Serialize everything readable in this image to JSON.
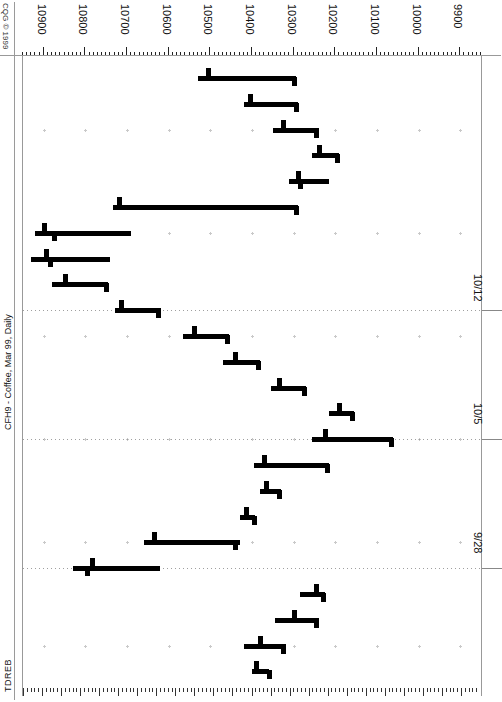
{
  "chart": {
    "copyright": "CQG © 1999",
    "title": "CFH9 - Coffee, Mar 99, Daily",
    "study_label": "TDREB",
    "orientation": "rotated-90",
    "accent_color": "#000000",
    "grid_color": "#c9c9c9",
    "frame_color": "#999999"
  },
  "price_axis": {
    "labels": [
      "10900",
      "10800",
      "10700",
      "10600",
      "10500",
      "10400",
      "10300",
      "10200",
      "10100",
      "10000",
      "9900"
    ],
    "min": 9850,
    "max": 10950,
    "step": 100
  },
  "date_axis": {
    "labels": [
      "10/12",
      "10/5",
      "9/28"
    ]
  },
  "chart_data": {
    "type": "ohlc",
    "title": "CFH9 - Coffee, Mar 99, Daily",
    "xlabel": "Date",
    "ylabel": "Price",
    "ylim": [
      9850,
      10950
    ],
    "grid": true,
    "legend": false,
    "price_ticks": [
      10900,
      10800,
      10700,
      10600,
      10500,
      10400,
      10300,
      10200,
      10100,
      10000,
      9900
    ],
    "date_ticks": [
      "10/12",
      "10/5",
      "9/28"
    ],
    "columns": [
      "date",
      "open",
      "high",
      "low",
      "close"
    ],
    "bars": [
      {
        "date": "9/22",
        "open": 10395,
        "high": 10400,
        "low": 10360,
        "close": 10365
      },
      {
        "date": "9/23",
        "open": 10385,
        "high": 10420,
        "low": 10320,
        "close": 10330
      },
      {
        "date": "9/24",
        "open": 10305,
        "high": 10345,
        "low": 10240,
        "close": 10250
      },
      {
        "date": "9/25",
        "open": 10250,
        "high": 10285,
        "low": 10225,
        "close": 10235
      },
      {
        "date": "9/28",
        "open": 10790,
        "high": 10830,
        "low": 10620,
        "close": 10800
      },
      {
        "date": "9/29",
        "open": 10640,
        "high": 10660,
        "low": 10430,
        "close": 10445
      },
      {
        "date": "9/30",
        "open": 10420,
        "high": 10430,
        "low": 10395,
        "close": 10400
      },
      {
        "date": "10/1",
        "open": 10370,
        "high": 10380,
        "low": 10330,
        "close": 10340
      },
      {
        "date": "10/2",
        "open": 10375,
        "high": 10395,
        "low": 10215,
        "close": 10225
      },
      {
        "date": "10/5",
        "open": 10230,
        "high": 10255,
        "low": 10060,
        "close": 10070
      },
      {
        "date": "10/6",
        "open": 10195,
        "high": 10215,
        "low": 10155,
        "close": 10165
      },
      {
        "date": "10/7",
        "open": 10340,
        "high": 10355,
        "low": 10270,
        "close": 10280
      },
      {
        "date": "10/8",
        "open": 10445,
        "high": 10470,
        "low": 10380,
        "close": 10390
      },
      {
        "date": "10/9",
        "open": 10545,
        "high": 10565,
        "low": 10455,
        "close": 10465
      },
      {
        "date": "10/12",
        "open": 10720,
        "high": 10730,
        "low": 10620,
        "close": 10630
      },
      {
        "date": "10/13",
        "open": 10855,
        "high": 10880,
        "low": 10745,
        "close": 10755
      },
      {
        "date": "10/14",
        "open": 10900,
        "high": 10930,
        "low": 10740,
        "close": 10890
      },
      {
        "date": "10/15",
        "open": 10905,
        "high": 10920,
        "low": 10690,
        "close": 10880
      },
      {
        "date": "10/16",
        "open": 10725,
        "high": 10735,
        "low": 10290,
        "close": 10300
      },
      {
        "date": "10/19",
        "open": 10295,
        "high": 10310,
        "low": 10215,
        "close": 10290
      },
      {
        "date": "10/20",
        "open": 10245,
        "high": 10255,
        "low": 10190,
        "close": 10200
      },
      {
        "date": "10/21",
        "open": 10330,
        "high": 10350,
        "low": 10240,
        "close": 10250
      },
      {
        "date": "10/22",
        "open": 10410,
        "high": 10420,
        "low": 10290,
        "close": 10300
      },
      {
        "date": "10/23",
        "open": 10510,
        "high": 10530,
        "low": 10295,
        "close": 10305
      }
    ]
  }
}
